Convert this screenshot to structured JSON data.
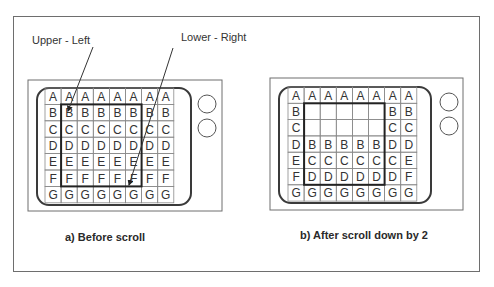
{
  "callouts": {
    "upper_left": "Upper - Left",
    "lower_right": "Lower - Right"
  },
  "panels": [
    {
      "id": "before",
      "caption": "a) Before scroll",
      "grid": [
        [
          "A",
          "A",
          "A",
          "A",
          "A",
          "A",
          "A",
          "A"
        ],
        [
          "B",
          "B",
          "B",
          "B",
          "B",
          "B",
          "B",
          "B"
        ],
        [
          "C",
          "C",
          "C",
          "C",
          "C",
          "C",
          "C",
          "C"
        ],
        [
          "D",
          "D",
          "D",
          "D",
          "D",
          "D",
          "D",
          "D"
        ],
        [
          "E",
          "E",
          "E",
          "E",
          "E",
          "E",
          "E",
          "E"
        ],
        [
          "F",
          "F",
          "F",
          "F",
          "F",
          "F",
          "F",
          "F"
        ],
        [
          "G",
          "G",
          "G",
          "G",
          "G",
          "G",
          "G",
          "G"
        ]
      ],
      "highlight": {
        "row_start": 1,
        "row_end": 5,
        "col_start": 1,
        "col_end": 5
      },
      "buttons": [
        "round-button-top",
        "round-button-bottom"
      ]
    },
    {
      "id": "after",
      "caption": "b) After scroll down by 2",
      "grid": [
        [
          "A",
          "A",
          "A",
          "A",
          "A",
          "A",
          "A",
          "A"
        ],
        [
          "B",
          "",
          "",
          "",
          "",
          "",
          "B",
          "B"
        ],
        [
          "C",
          "",
          "",
          "",
          "",
          "",
          "C",
          "C"
        ],
        [
          "D",
          "B",
          "B",
          "B",
          "B",
          "B",
          "D",
          "D"
        ],
        [
          "E",
          "C",
          "C",
          "C",
          "C",
          "C",
          "C",
          "E"
        ],
        [
          "F",
          "D",
          "D",
          "D",
          "D",
          "D",
          "D",
          "F"
        ],
        [
          "G",
          "G",
          "G",
          "G",
          "G",
          "G",
          "G",
          "G"
        ]
      ],
      "highlight": {
        "row_start": 1,
        "row_end": 5,
        "col_start": 1,
        "col_end": 5
      },
      "buttons": [
        "round-button-top",
        "round-button-bottom"
      ]
    }
  ],
  "colors": {
    "line": "#3a3a3a",
    "grid_line": "#8a8a8a",
    "frame": "#6e6e6e",
    "text": "#333333"
  }
}
